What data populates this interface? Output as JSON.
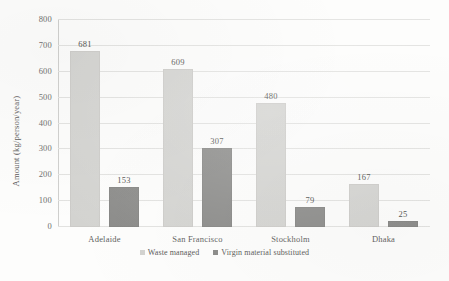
{
  "chart_data": {
    "type": "bar",
    "title": "",
    "xlabel": "",
    "ylabel": "Amount (kg/person/year)",
    "ylim": [
      0,
      800
    ],
    "yticks": [
      "0",
      "100",
      "200",
      "300",
      "400",
      "500",
      "600",
      "700",
      "800"
    ],
    "grid": true,
    "legend_position": "bottom",
    "categories": [
      "Adelaide",
      "San Francisco",
      "Stockholm",
      "Dhaka"
    ],
    "series": [
      {
        "name": "Waste managed",
        "color": "#d3d3d0",
        "values": [
          681,
          609,
          480,
          167
        ]
      },
      {
        "name": "Virgin material substituted",
        "color": "#8a8a88",
        "values": [
          153,
          307,
          79,
          25
        ]
      }
    ]
  }
}
